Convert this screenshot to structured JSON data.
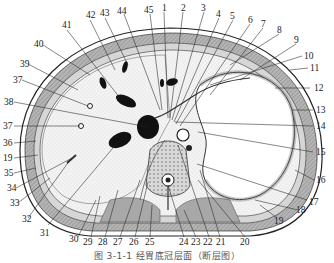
{
  "figure": {
    "caption": "图 3-1-1  经胃底冠层面（断层图）",
    "type": "anatomical cross-section",
    "labels_top": [
      "41",
      "42",
      "43",
      "44",
      "45",
      "1",
      "2",
      "3",
      "4",
      "5",
      "6",
      "7",
      "8"
    ],
    "labels_right": [
      "9",
      "10",
      "11",
      "12",
      "13",
      "14",
      "15",
      "16",
      "17",
      "18",
      "19"
    ],
    "labels_bottom": [
      "20",
      "21",
      "22",
      "23",
      "24",
      "25",
      "26",
      "27",
      "28",
      "29",
      "30",
      "31"
    ],
    "labels_left": [
      "40",
      "39",
      "37",
      "38",
      "37",
      "36",
      "19",
      "35",
      "34",
      "33",
      "32"
    ],
    "colors": {
      "ink": "#1a1a1a",
      "muscle": "#9a9a9a",
      "muscle_light": "#c4c4c4",
      "organ_fill": "#efefef",
      "stomach_fill": "#ffffff",
      "background": "#ffffff"
    }
  }
}
